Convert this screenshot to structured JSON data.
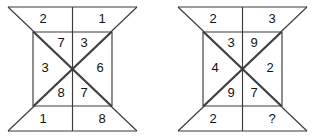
{
  "figures": [
    {
      "name": "left-figure",
      "cells": {
        "outer_top_left": "2",
        "outer_top_right": "1",
        "inner_top_left": "7",
        "inner_top_right": "3",
        "inner_middle_left": "3",
        "inner_middle_right": "6",
        "inner_bottom_left": "8",
        "inner_bottom_right": "7",
        "outer_bottom_left": "1",
        "outer_bottom_right": "8"
      }
    },
    {
      "name": "right-figure",
      "cells": {
        "outer_top_left": "2",
        "outer_top_right": "3",
        "inner_top_left": "3",
        "inner_top_right": "9",
        "inner_middle_left": "4",
        "inner_middle_right": "2",
        "inner_bottom_left": "9",
        "inner_bottom_right": "7",
        "outer_bottom_left": "2",
        "outer_bottom_right": "?"
      }
    }
  ],
  "style": {
    "line_color": "#3b3b3b",
    "text_color": "#111111",
    "background": "#ffffff"
  }
}
